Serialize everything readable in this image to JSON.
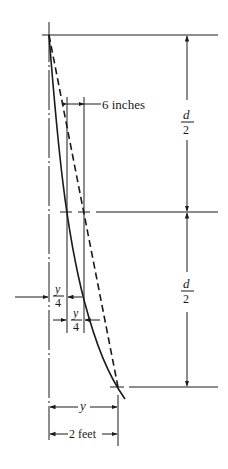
{
  "diagram": {
    "labels": {
      "six_inches": "6 inches",
      "d_over_2_top": {
        "num": "d",
        "den": "2"
      },
      "d_over_2_bottom": {
        "num": "d",
        "den": "2"
      },
      "y_over_4_left": {
        "num": "y",
        "den": "4"
      },
      "y_over_4_right": {
        "num": "y",
        "den": "4"
      },
      "y": "y",
      "two_feet": "2 feet"
    },
    "colors": {
      "ink": "#1a1a1a",
      "background": "#ffffff"
    }
  }
}
